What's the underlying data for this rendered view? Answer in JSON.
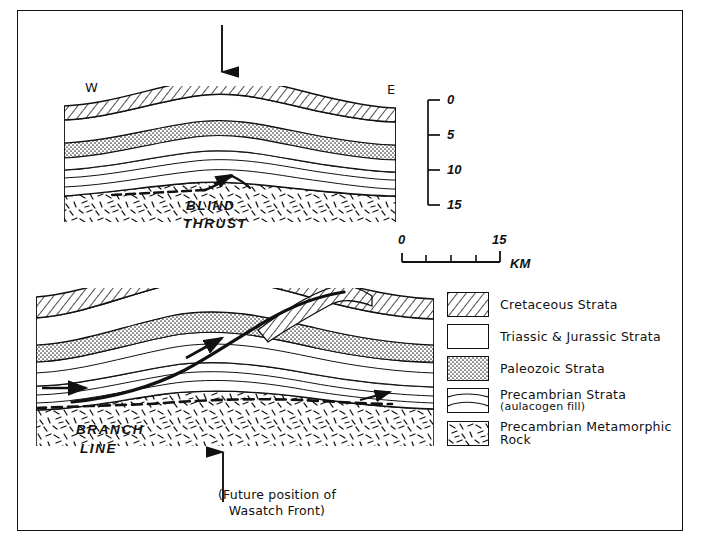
{
  "upper_section": {
    "west_label": "W",
    "east_label": "E",
    "fault_label_line1": "BLIND",
    "fault_label_line2": "THRUST",
    "arrow": "down-arrow"
  },
  "lower_section": {
    "fault_label_line1": "BRANCH",
    "fault_label_line2": "LINE",
    "arrow": "up-arrow"
  },
  "depth_scale": {
    "ticks": [
      "0",
      "5",
      "10",
      "15"
    ],
    "unit": "km"
  },
  "distance_scale": {
    "start": "0",
    "end": "15",
    "unit": "KM",
    "segments": 4
  },
  "caption": {
    "line1": "(Future position of",
    "line2": "Wasatch Front)"
  },
  "legend": {
    "items": [
      {
        "label": "Cretaceous Strata",
        "sub": "",
        "pattern": "diagonal-hatch"
      },
      {
        "label": "Triassic & Jurassic Strata",
        "sub": "",
        "pattern": "blank"
      },
      {
        "label": "Paleozoic Strata",
        "sub": "",
        "pattern": "stipple"
      },
      {
        "label": "Precambrian Strata",
        "sub": "(aulacogen fill)",
        "pattern": "wavy-lines"
      },
      {
        "label": "Precambrian Metamorphic Rock",
        "sub": "",
        "pattern": "dashes"
      }
    ]
  },
  "colors": {
    "ink": "#111111",
    "paper": "#ffffff"
  }
}
